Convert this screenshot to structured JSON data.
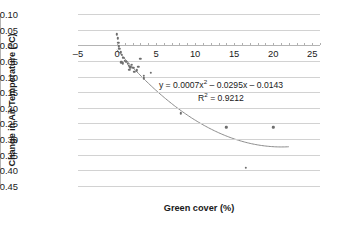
{
  "chart_data": {
    "type": "scatter",
    "title": "",
    "xlabel": "Green cover (%)",
    "ylabel": "Change in Air Temperature (°C)",
    "xlim": [
      -5,
      26
    ],
    "ylim": [
      -0.45,
      0.1
    ],
    "grid": true,
    "legend": "none",
    "x_ticks": [
      -5,
      0,
      5,
      10,
      15,
      20,
      25
    ],
    "x_tick_labels": [
      "–5",
      "0",
      "5",
      "10",
      "15",
      "20",
      "25"
    ],
    "x_minor_tick_step": 1,
    "y_ticks": [
      0.1,
      0.05,
      0.0,
      -0.05,
      -0.1,
      -0.15,
      -0.2,
      -0.25,
      -0.3,
      -0.35,
      -0.4,
      -0.45
    ],
    "y_tick_labels": [
      "0.10",
      "0.05",
      "0.00",
      "–0.05",
      "–0.10",
      "–0.15",
      "–0.20",
      "–0.25",
      "–0.30",
      "–0.35",
      "–0.40",
      "–0.45"
    ],
    "points": [
      {
        "x": 0.0,
        "y": 0.035
      },
      {
        "x": 0.1,
        "y": 0.022
      },
      {
        "x": 0.15,
        "y": 0.008
      },
      {
        "x": 0.2,
        "y": -0.003
      },
      {
        "x": 0.3,
        "y": -0.012
      },
      {
        "x": 0.45,
        "y": -0.022
      },
      {
        "x": 0.6,
        "y": -0.03
      },
      {
        "x": 0.8,
        "y": -0.04
      },
      {
        "x": 0.55,
        "y": -0.055
      },
      {
        "x": 0.75,
        "y": -0.058
      },
      {
        "x": 1.0,
        "y": -0.05
      },
      {
        "x": 1.2,
        "y": -0.052
      },
      {
        "x": 1.35,
        "y": -0.06
      },
      {
        "x": 1.5,
        "y": -0.065
      },
      {
        "x": 1.7,
        "y": -0.07
      },
      {
        "x": 1.55,
        "y": -0.078
      },
      {
        "x": 1.9,
        "y": -0.062
      },
      {
        "x": 2.1,
        "y": -0.072
      },
      {
        "x": 2.2,
        "y": -0.085
      },
      {
        "x": 2.5,
        "y": -0.08
      },
      {
        "x": 2.7,
        "y": -0.068
      },
      {
        "x": 3.0,
        "y": -0.043
      },
      {
        "x": 3.4,
        "y": -0.098
      },
      {
        "x": 3.45,
        "y": -0.105
      },
      {
        "x": 4.3,
        "y": -0.088
      },
      {
        "x": 8.2,
        "y": -0.218
      },
      {
        "x": 14.0,
        "y": -0.262
      },
      {
        "x": 16.5,
        "y": -0.392
      },
      {
        "x": 20.0,
        "y": -0.262
      }
    ],
    "trendline": {
      "type": "quadratic",
      "a": 0.0007,
      "b": -0.0295,
      "c": -0.0143,
      "x_start": 0.0,
      "x_end": 22.0,
      "color": "#8c8c8c"
    },
    "annotations": {
      "equation": "y = 0.0007x² – 0.0295x – 0.0143",
      "equation_prefix": "y = 0.0007x",
      "equation_exponent": "2",
      "equation_suffix": " – 0.0295x – 0.0143",
      "r_squared_prefix": "R",
      "r_squared_exponent": "2",
      "r_squared_suffix": " = 0.9212",
      "r_squared": "R² = 0.9212"
    },
    "colors": {
      "point": "#6e6e6e",
      "trendline": "#8c8c8c",
      "gridline": "#d2d2d2",
      "axis": "#b4b4b4",
      "text": "#1a1a1a"
    }
  }
}
